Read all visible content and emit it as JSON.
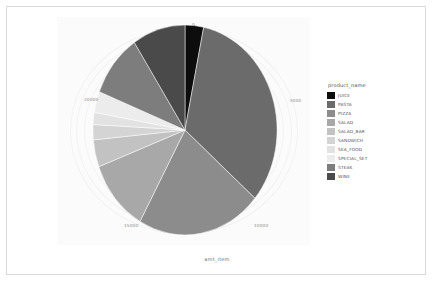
{
  "figure": {
    "x_axis_title": "amt_item",
    "y_axis_title": "",
    "tick_labels": {
      "t0": "0",
      "t5000": "5000",
      "t10000": "10000",
      "t15000": "15000",
      "t20000": "20000"
    }
  },
  "legend": {
    "title": "product_name",
    "entries": [
      {
        "label": "JUICE",
        "color": "#0d0d0d"
      },
      {
        "label": "PASTA",
        "color": "#6b6b6b"
      },
      {
        "label": "PIZZA",
        "color": "#8c8c8c"
      },
      {
        "label": "SALAD",
        "color": "#a8a8a8"
      },
      {
        "label": "SALAD_BAR",
        "color": "#c2c2c2"
      },
      {
        "label": "SANDWICH",
        "color": "#d4d4d4"
      },
      {
        "label": "SEA_FOOD",
        "color": "#e2e2e2"
      },
      {
        "label": "SPECIAL_SET",
        "color": "#ececec"
      },
      {
        "label": "STEAK",
        "color": "#7d7d7d"
      },
      {
        "label": "WINE",
        "color": "#4a4a4a"
      }
    ]
  },
  "chart_data": {
    "type": "pie",
    "title": "",
    "xlabel": "amt_item",
    "ylabel": "",
    "legend_position": "right",
    "legend_title": "product_name",
    "grid": true,
    "total": 21500,
    "axis_tick_values": [
      0,
      5000,
      10000,
      15000,
      20000
    ],
    "categories": [
      "JUICE",
      "PASTA",
      "PIZZA",
      "SALAD",
      "SALAD_BAR",
      "SANDWICH",
      "SEA_FOOD",
      "SPECIAL_SET",
      "STEAK",
      "WINE"
    ],
    "values": [
      700,
      7100,
      4700,
      2400,
      900,
      500,
      400,
      700,
      2100,
      2000
    ],
    "colors": [
      "#0d0d0d",
      "#6b6b6b",
      "#8c8c8c",
      "#a8a8a8",
      "#c2c2c2",
      "#d4d4d4",
      "#e2e2e2",
      "#ececec",
      "#7d7d7d",
      "#4a4a4a"
    ],
    "slices": [
      {
        "name": "JUICE",
        "value": 700,
        "percent": 3.3,
        "start_deg": 0.0,
        "end_deg": 11.7,
        "color": "#0d0d0d"
      },
      {
        "name": "PASTA",
        "value": 7100,
        "percent": 33.0,
        "start_deg": 11.7,
        "end_deg": 130.6,
        "color": "#6b6b6b"
      },
      {
        "name": "PIZZA",
        "value": 4700,
        "percent": 21.9,
        "start_deg": 130.6,
        "end_deg": 209.3,
        "color": "#8c8c8c"
      },
      {
        "name": "SALAD",
        "value": 2400,
        "percent": 11.2,
        "start_deg": 209.3,
        "end_deg": 249.5,
        "color": "#a8a8a8"
      },
      {
        "name": "SALAD_BAR",
        "value": 900,
        "percent": 4.2,
        "start_deg": 249.5,
        "end_deg": 264.6,
        "color": "#c2c2c2"
      },
      {
        "name": "SANDWICH",
        "value": 500,
        "percent": 2.3,
        "start_deg": 264.6,
        "end_deg": 273.0,
        "color": "#d4d4d4"
      },
      {
        "name": "SEA_FOOD",
        "value": 400,
        "percent": 1.9,
        "start_deg": 273.0,
        "end_deg": 279.7,
        "color": "#e2e2e2"
      },
      {
        "name": "SPECIAL_SET",
        "value": 700,
        "percent": 3.3,
        "start_deg": 279.7,
        "end_deg": 291.4,
        "color": "#ececec"
      },
      {
        "name": "STEAK",
        "value": 2100,
        "percent": 9.8,
        "start_deg": 291.4,
        "end_deg": 326.6,
        "color": "#7d7d7d"
      },
      {
        "name": "WINE",
        "value": 2000,
        "percent": 9.3,
        "start_deg": 326.6,
        "end_deg": 360.0,
        "color": "#4a4a4a"
      }
    ]
  }
}
